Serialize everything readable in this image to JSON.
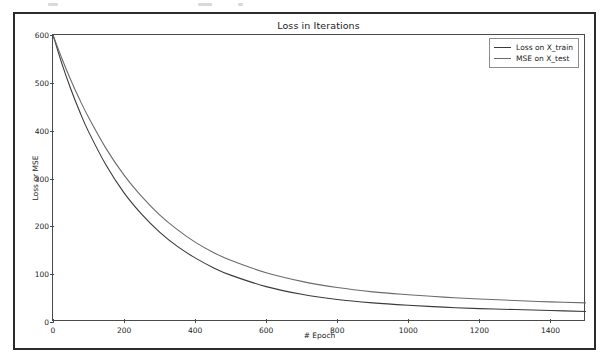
{
  "figure": {
    "title": "Loss in Iterations"
  },
  "chart_data": {
    "type": "line",
    "title": "Loss in Iterations",
    "xlabel": "# Epoch",
    "ylabel": "Loss or MSE",
    "xlim": [
      0,
      1500
    ],
    "ylim": [
      0,
      600
    ],
    "xticks": [
      0,
      200,
      400,
      600,
      800,
      1000,
      1200,
      1400
    ],
    "yticks": [
      0,
      100,
      200,
      300,
      400,
      500,
      600
    ],
    "grid": false,
    "legend_position": "upper right",
    "series": [
      {
        "name": "Loss on X_train",
        "color": "#3a3a3a",
        "x": [
          0,
          25,
          50,
          75,
          100,
          150,
          200,
          250,
          300,
          350,
          400,
          450,
          500,
          600,
          700,
          800,
          900,
          1000,
          1100,
          1200,
          1300,
          1400,
          1500
        ],
        "values": [
          600,
          540,
          487,
          440,
          398,
          327,
          270,
          225,
          188,
          158,
          134,
          114,
          98,
          74,
          58,
          47,
          40,
          35,
          31,
          28,
          26,
          24,
          22
        ]
      },
      {
        "name": "MSE on X_test",
        "color": "#6b6b6b",
        "x": [
          0,
          25,
          50,
          75,
          100,
          150,
          200,
          250,
          300,
          350,
          400,
          450,
          500,
          600,
          700,
          800,
          900,
          1000,
          1100,
          1200,
          1300,
          1400,
          1500
        ],
        "values": [
          600,
          551,
          506,
          465,
          428,
          362,
          307,
          262,
          224,
          193,
          167,
          146,
          129,
          103,
          85,
          72,
          63,
          57,
          52,
          48,
          45,
          42,
          40
        ]
      }
    ]
  }
}
